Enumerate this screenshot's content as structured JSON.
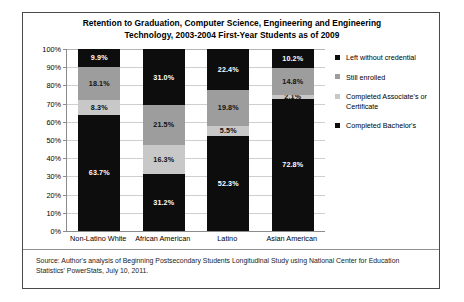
{
  "chart_data": {
    "type": "bar",
    "subtype": "stacked-100-percent",
    "title": "Retention to Graduation, Computer Science, Engineering and Engineering Technology, 2003-2004 First-Year Students as of 2009",
    "title_lines": [
      "Retention to Graduation, Computer Science, Engineering and Engineering",
      "Technology, 2003-2004 First-Year Students as of 2009"
    ],
    "xlabel": "",
    "ylabel": "",
    "categories": [
      "Non-Latino White",
      "African American",
      "Latino",
      "Asian American"
    ],
    "ylim": [
      0,
      100
    ],
    "ytick_labels": [
      "0%",
      "10%",
      "20%",
      "30%",
      "40%",
      "50%",
      "60%",
      "70%",
      "80%",
      "90%",
      "100%"
    ],
    "ytick_values": [
      0,
      10,
      20,
      30,
      40,
      50,
      60,
      70,
      80,
      90,
      100
    ],
    "grid": true,
    "legend_position": "right",
    "series": [
      {
        "name": "Completed Bachelor's",
        "color": "#0d0d0d",
        "values": [
          63.7,
          31.2,
          52.3,
          72.8
        ],
        "labels": [
          "63.7%",
          "31.2%",
          "52.3%",
          "72.8%"
        ]
      },
      {
        "name": "Completed Associate's  or Certificate",
        "color": "#c8c8c8",
        "values": [
          8.3,
          16.3,
          5.5,
          2.1
        ],
        "labels": [
          "8.3%",
          "16.3%",
          "5.5%",
          "2.1%"
        ]
      },
      {
        "name": "Still enrolled",
        "color": "#9d9d9d",
        "values": [
          18.1,
          21.5,
          19.8,
          14.8
        ],
        "labels": [
          "18.1%",
          "21.5%",
          "19.8%",
          "14.8%"
        ]
      },
      {
        "name": "Left without credential",
        "color": "#0d0d0d",
        "values": [
          9.9,
          31.0,
          22.4,
          10.2
        ],
        "labels": [
          "9.9%",
          "31.0%",
          "22.4%",
          "10.2%"
        ]
      }
    ]
  },
  "legend": {
    "items": [
      {
        "label": "Left without credential",
        "swatch": "sw-dark"
      },
      {
        "label": "Still enrolled",
        "swatch": "sw-mid"
      },
      {
        "label": "Completed Associate's  or Certificate",
        "swatch": "sw-light"
      },
      {
        "label": "Completed Bachelor's",
        "swatch": "sw-dark"
      }
    ]
  },
  "source": {
    "text": "Source: Author's analysis of Beginning Postsecondary Students Longitudinal Study using National Center for Education Statistics' PowerStats, July 10, 2011."
  }
}
